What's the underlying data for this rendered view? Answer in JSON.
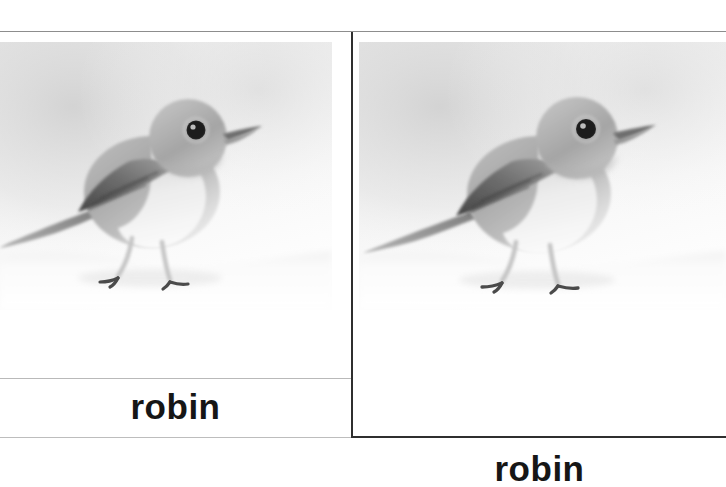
{
  "slide": {
    "kind": "flashcard-pair",
    "background_color": "#ffffff",
    "rule_color": "#8d8d8d",
    "divider_color": "#2f2f2f",
    "caption_color": "#161616"
  },
  "cards": [
    {
      "id": "left",
      "caption": "robin",
      "image": {
        "name": "robin-photo",
        "alt": "Black and white photograph of a robin standing on snow, facing right",
        "subject": "robin",
        "palette": {
          "background_light": "#f4f4f4",
          "background_mid": "#dcdcdc",
          "snow": "#fdfdfd",
          "body_light": "#cfcfcf",
          "body_mid": "#a8a8a8",
          "body_dark": "#7c7c7c",
          "wing_dark": "#4e4e4e",
          "breast_white": "#f2f2f2",
          "eye": "#1a1a1a",
          "beak": "#6a6a6a",
          "leg": "#bdbdbd"
        }
      }
    },
    {
      "id": "right",
      "caption": "robin",
      "image": {
        "name": "robin-photo",
        "alt": "Black and white photograph of a robin standing on snow, facing right",
        "subject": "robin",
        "palette": {
          "background_light": "#f4f4f4",
          "background_mid": "#dcdcdc",
          "snow": "#fdfdfd",
          "body_light": "#cfcfcf",
          "body_mid": "#a8a8a8",
          "body_dark": "#7c7c7c",
          "wing_dark": "#4e4e4e",
          "breast_white": "#f2f2f2",
          "eye": "#1a1a1a",
          "beak": "#6a6a6a",
          "leg": "#bdbdbd"
        }
      }
    }
  ]
}
